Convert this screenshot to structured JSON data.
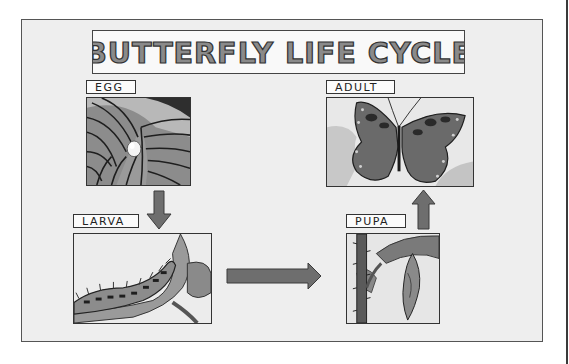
{
  "title": "BUTTERFLY LIFE CYCLE",
  "stages": {
    "egg": {
      "label": "EGG",
      "image": "leaf-with-egg"
    },
    "larva": {
      "label": "LARVA",
      "image": "caterpillar-on-stem"
    },
    "pupa": {
      "label": "PUPA",
      "image": "chrysalis-on-stem"
    },
    "adult": {
      "label": "ADULT",
      "image": "butterfly"
    }
  },
  "flow": [
    {
      "from": "EGG",
      "to": "LARVA",
      "direction": "down"
    },
    {
      "from": "LARVA",
      "to": "PUPA",
      "direction": "right"
    },
    {
      "from": "PUPA",
      "to": "ADULT",
      "direction": "up"
    }
  ],
  "colors": {
    "background": "#eeeeee",
    "frame": "#555555",
    "arrow_fill": "#6e6e6e",
    "title_fill": "#8a8a8a",
    "title_stroke": "#333333"
  }
}
